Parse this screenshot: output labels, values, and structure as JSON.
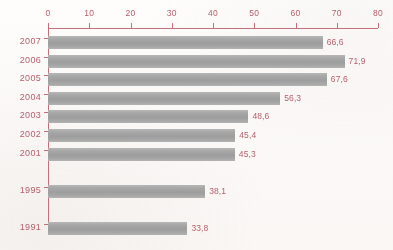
{
  "chart_data": {
    "type": "bar",
    "orientation": "horizontal",
    "title": "",
    "subtitle": "",
    "xlabel": "",
    "ylabel": "",
    "categories": [
      "2007",
      "2006",
      "2005",
      "2004",
      "2003",
      "2002",
      "2001",
      "1995",
      "1991"
    ],
    "values": [
      66.6,
      71.9,
      67.6,
      56.3,
      48.6,
      45.4,
      45.3,
      38.1,
      33.8
    ],
    "value_labels": [
      "66,6",
      "71,9",
      "67,6",
      "56,3",
      "48,6",
      "45,4",
      "45,3",
      "38,1",
      "33,8"
    ],
    "xlim": [
      0,
      80
    ],
    "xticks": [
      0,
      10,
      20,
      30,
      40,
      50,
      60,
      70,
      80
    ],
    "xtick_labels": [
      "0",
      "10",
      "20",
      "30",
      "40",
      "50",
      "60",
      "70",
      "80"
    ],
    "grid": false,
    "legend": null,
    "decimal_separator": ",",
    "row_slots": [
      0,
      1,
      2,
      3,
      4,
      5,
      6,
      8,
      10
    ],
    "colors": {
      "axis": "#c4707a",
      "tick_label": "#b4606c",
      "category_label": "#b4606c",
      "value_label": "#b4606c",
      "bar_fill": "#a8a8a8",
      "background": "#fdfbfa"
    }
  }
}
